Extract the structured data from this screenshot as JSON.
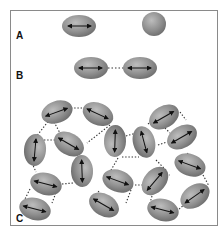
{
  "figure": {
    "panels": [
      {
        "label": "A",
        "description": "Single ellipsoidal grain with dipole arrow, and a spherical grain"
      },
      {
        "label": "B",
        "description": "Two ellipsoidal grains with dipole arrows linked by a dotted bond"
      },
      {
        "label": "C",
        "description": "Network of ellipsoidal grains with dipole arrows connected by dotted bonds"
      }
    ],
    "colors": {
      "grain_fill": "#8f8f8f",
      "grain_highlight": "#b8b8b8",
      "grain_edge": "#6a6a6a",
      "arrow": "#111111",
      "bond": "#333333",
      "frame": "#8a8a8a"
    }
  }
}
